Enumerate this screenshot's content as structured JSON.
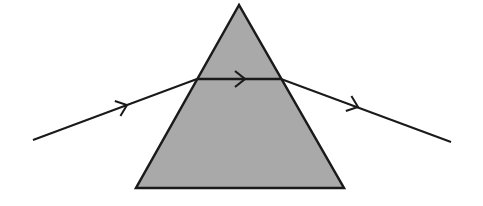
{
  "diagram": {
    "type": "light-refraction-through-prism",
    "colors": {
      "prism_fill": "#a9a9a9",
      "stroke": "#1a1a1a",
      "background": "#ffffff"
    },
    "prism": {
      "apex": [
        239,
        5
      ],
      "base_left": [
        136,
        188
      ],
      "base_right": [
        344,
        188
      ]
    },
    "rays": {
      "incident": {
        "from": [
          33,
          140
        ],
        "to": [
          197,
          79
        ],
        "arrow_at": [
          127,
          105
        ]
      },
      "internal": {
        "from": [
          197,
          79
        ],
        "to": [
          281,
          79
        ],
        "arrow_at": [
          245,
          79
        ]
      },
      "emergent": {
        "from": [
          281,
          79
        ],
        "to": [
          451,
          142
        ],
        "arrow_at": [
          358,
          107
        ]
      }
    }
  }
}
